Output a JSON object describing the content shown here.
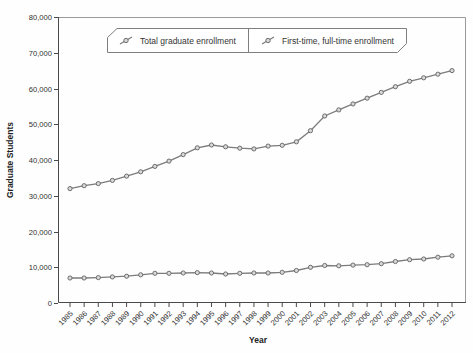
{
  "chart_data": {
    "type": "line",
    "title": "",
    "xlabel": "Year",
    "ylabel": "Graduate Students",
    "x": [
      1985,
      1986,
      1987,
      1988,
      1989,
      1990,
      1991,
      1992,
      1993,
      1994,
      1995,
      1996,
      1997,
      1998,
      1999,
      2000,
      2001,
      2002,
      2003,
      2004,
      2005,
      2006,
      2007,
      2008,
      2009,
      2010,
      2011,
      2012
    ],
    "ylim": [
      0,
      80000
    ],
    "ytick_step": 10000,
    "grid": false,
    "legend_position": "top-center",
    "series": [
      {
        "name": "Total graduate enrollment",
        "values": [
          32000,
          32800,
          33400,
          34300,
          35500,
          36700,
          38200,
          39700,
          41500,
          43400,
          44200,
          43700,
          43300,
          43100,
          43900,
          44100,
          45100,
          48200,
          52300,
          54000,
          55700,
          57300,
          58900,
          60500,
          62000,
          63000,
          64000,
          65000
        ]
      },
      {
        "name": "First-time, full-time enrollment",
        "values": [
          7000,
          7000,
          7100,
          7300,
          7500,
          7900,
          8300,
          8300,
          8400,
          8500,
          8400,
          8100,
          8300,
          8400,
          8400,
          8600,
          9100,
          10000,
          10500,
          10400,
          10600,
          10700,
          11000,
          11600,
          12100,
          12300,
          12800,
          13200
        ]
      }
    ],
    "colors": {
      "line": "#7c7c7c",
      "marker_fill": "#d9d9d9",
      "marker_stroke": "#616161",
      "axis": "#4a4a4a",
      "box_border": "#9a9a9a",
      "text": "#303030",
      "legend_border": "#7f7f7f",
      "background": "#fefefe"
    }
  },
  "legend": {
    "items": [
      {
        "label": "Total graduate enrollment",
        "icon": "slanted-line-marker-icon"
      },
      {
        "label": "First-time, full-time enrollment",
        "icon": "slanted-line-marker-icon"
      }
    ]
  },
  "axes": {
    "y_tick_labels": [
      "0",
      "10,000",
      "20,000",
      "30,000",
      "40,000",
      "50,000",
      "60,000",
      "70,000",
      "80,000"
    ],
    "x_tick_labels": [
      "1985",
      "1986",
      "1987",
      "1988",
      "1989",
      "1990",
      "1991",
      "1992",
      "1993",
      "1994",
      "1995",
      "1996",
      "1997",
      "1998",
      "1999",
      "2000",
      "2001",
      "2002",
      "2003",
      "2004",
      "2005",
      "2006",
      "2007",
      "2008",
      "2009",
      "2010",
      "2011",
      "2012"
    ]
  }
}
